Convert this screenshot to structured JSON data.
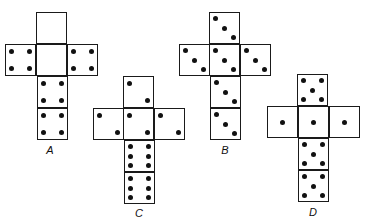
{
  "figure": {
    "title": "",
    "nets": [
      {
        "label": "A",
        "origin": [
          5,
          12
        ],
        "label_pos": [
          40,
          144
        ],
        "faces": [
          {
            "pos": "top",
            "x": 31,
            "y": 0,
            "pips": 0
          },
          {
            "pos": "left",
            "x": 0,
            "y": 32,
            "pips": 4
          },
          {
            "pos": "center",
            "x": 31,
            "y": 32,
            "pips": 0
          },
          {
            "pos": "right",
            "x": 62,
            "y": 32,
            "pips": 4
          },
          {
            "pos": "bottom1",
            "x": 32,
            "y": 64,
            "pips": 4
          },
          {
            "pos": "bottom2",
            "x": 32,
            "y": 96,
            "pips": 4
          }
        ]
      },
      {
        "label": "B",
        "origin": [
          179,
          12
        ],
        "label_pos": [
          215,
          144
        ],
        "faces": [
          {
            "pos": "top",
            "x": 30,
            "y": 0,
            "pips": 3
          },
          {
            "pos": "left",
            "x": 0,
            "y": 32,
            "pips": 3
          },
          {
            "pos": "center",
            "x": 30,
            "y": 32,
            "pips": 3
          },
          {
            "pos": "right",
            "x": 61,
            "y": 32,
            "pips": 3
          },
          {
            "pos": "bottom1",
            "x": 31,
            "y": 64,
            "pips": 3
          },
          {
            "pos": "bottom2",
            "x": 31,
            "y": 96,
            "pips": 3
          }
        ]
      },
      {
        "label": "C",
        "origin": [
          93,
          76
        ],
        "label_pos": [
          129,
          207
        ],
        "faces": [
          {
            "pos": "top",
            "x": 30,
            "y": 0,
            "pips": 2
          },
          {
            "pos": "left",
            "x": 0,
            "y": 32,
            "pips": 2
          },
          {
            "pos": "center",
            "x": 30,
            "y": 32,
            "pips": 2
          },
          {
            "pos": "right",
            "x": 61,
            "y": 32,
            "pips": 2
          },
          {
            "pos": "bottom1",
            "x": 31,
            "y": 64,
            "pips": 6
          },
          {
            "pos": "bottom2",
            "x": 31,
            "y": 96,
            "pips": 6
          }
        ]
      },
      {
        "label": "D",
        "origin": [
          267,
          74
        ],
        "label_pos": [
          303,
          206
        ],
        "faces": [
          {
            "pos": "top",
            "x": 30,
            "y": 0,
            "pips": 5
          },
          {
            "pos": "left",
            "x": 0,
            "y": 32,
            "pips": 1
          },
          {
            "pos": "center",
            "x": 31,
            "y": 32,
            "pips": 1
          },
          {
            "pos": "right",
            "x": 62,
            "y": 32,
            "pips": 1
          },
          {
            "pos": "bottom1",
            "x": 31,
            "y": 64,
            "pips": 5
          },
          {
            "pos": "bottom2",
            "x": 31,
            "y": 96,
            "pips": 5
          }
        ]
      }
    ]
  },
  "pip_layouts": {
    "0": [],
    "1": [
      [
        0.5,
        0.5
      ]
    ],
    "2": [
      [
        0.22,
        0.22
      ],
      [
        0.78,
        0.78
      ]
    ],
    "3": [
      [
        0.22,
        0.2
      ],
      [
        0.5,
        0.5
      ],
      [
        0.78,
        0.8
      ]
    ],
    "4": [
      [
        0.22,
        0.22
      ],
      [
        0.78,
        0.22
      ],
      [
        0.22,
        0.78
      ],
      [
        0.78,
        0.78
      ]
    ],
    "5": [
      [
        0.22,
        0.2
      ],
      [
        0.78,
        0.2
      ],
      [
        0.5,
        0.5
      ],
      [
        0.22,
        0.8
      ],
      [
        0.78,
        0.8
      ]
    ],
    "6": [
      [
        0.22,
        0.2
      ],
      [
        0.78,
        0.2
      ],
      [
        0.22,
        0.5
      ],
      [
        0.78,
        0.5
      ],
      [
        0.22,
        0.8
      ],
      [
        0.78,
        0.8
      ]
    ]
  }
}
